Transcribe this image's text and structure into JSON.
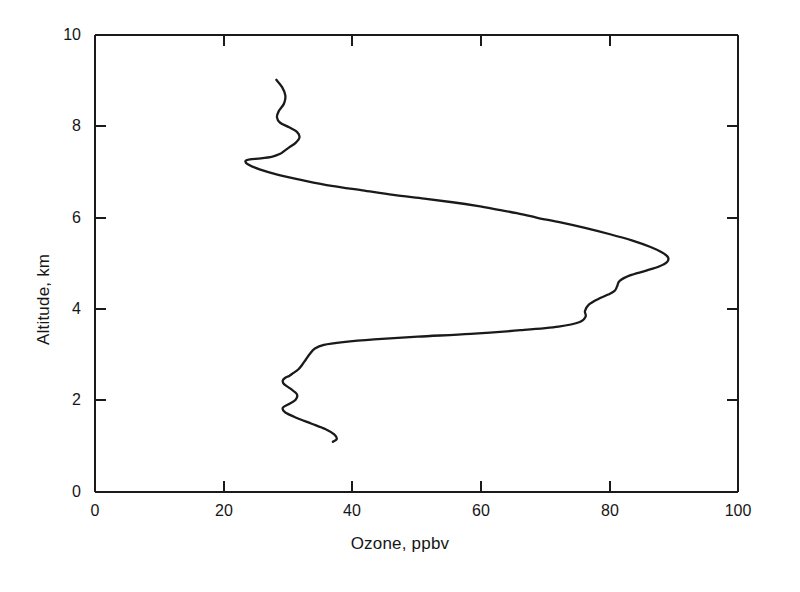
{
  "chart_data": {
    "type": "line",
    "title": "",
    "subtitle": "",
    "xlabel": "Ozone, ppbv",
    "ylabel": "Altitude, km",
    "xlim": [
      0,
      100
    ],
    "ylim": [
      0,
      10
    ],
    "xticks": [
      0,
      20,
      40,
      60,
      80,
      100
    ],
    "yticks": [
      0,
      2,
      4,
      6,
      8,
      10
    ],
    "xtick_labels": [
      "0",
      "20",
      "40",
      "60",
      "80",
      "100"
    ],
    "ytick_labels": [
      "0",
      "2",
      "4",
      "6",
      "8",
      "10"
    ],
    "grid": false,
    "legend": null,
    "orientation": "vertical-profile",
    "series": [
      {
        "name": "Ozone vertical profile",
        "color": "#1a1a1a",
        "x_values": [
          28.2,
          29.1,
          29.6,
          29.4,
          28.6,
          28.3,
          28.8,
          30.2,
          31.4,
          31.8,
          31.2,
          30.2,
          29.4,
          28.8,
          27.6,
          25.8,
          24.1,
          23.4,
          23.9,
          25.6,
          28.5,
          32.4,
          36.8,
          41.6,
          46.4,
          51.2,
          55.6,
          59.4,
          62.6,
          65.6,
          68.8,
          72.4,
          76.2,
          80.1,
          83.6,
          86.4,
          88.2,
          89.1,
          89.0,
          87.8,
          85.6,
          83.2,
          81.6,
          81.2,
          80.8,
          79.8,
          78.2,
          76.8,
          76.2,
          76.3,
          75.4,
          72.1,
          66.2,
          58.4,
          50.2,
          43.4,
          38.6,
          35.6,
          34.2,
          33.4,
          32.8,
          32.2,
          31.6,
          30.8,
          30.2,
          29.6,
          29.2,
          29.4,
          30.4,
          31.4,
          31.2,
          30.1,
          29.2,
          29.6,
          31.4,
          33.6,
          35.8,
          37.2,
          37.6,
          37.0
        ],
        "y_values": [
          9.02,
          8.86,
          8.68,
          8.5,
          8.34,
          8.2,
          8.08,
          7.98,
          7.88,
          7.76,
          7.64,
          7.54,
          7.46,
          7.4,
          7.34,
          7.3,
          7.28,
          7.24,
          7.16,
          7.06,
          6.94,
          6.82,
          6.7,
          6.6,
          6.5,
          6.42,
          6.34,
          6.26,
          6.18,
          6.1,
          6.0,
          5.9,
          5.78,
          5.64,
          5.5,
          5.36,
          5.24,
          5.14,
          5.04,
          4.94,
          4.84,
          4.74,
          4.62,
          4.5,
          4.4,
          4.32,
          4.22,
          4.1,
          3.96,
          3.84,
          3.72,
          3.62,
          3.54,
          3.46,
          3.4,
          3.34,
          3.28,
          3.22,
          3.14,
          3.02,
          2.9,
          2.78,
          2.68,
          2.6,
          2.54,
          2.5,
          2.44,
          2.36,
          2.26,
          2.14,
          2.02,
          1.92,
          1.84,
          1.74,
          1.62,
          1.5,
          1.38,
          1.26,
          1.16,
          1.1
        ],
        "peak_ozone_ppbv": 89,
        "peak_altitude_km": 5.1,
        "min_ozone_ppbv": 23.4,
        "min_altitude_km": 7.24,
        "top_altitude_km": 9.0,
        "bottom_altitude_km": 1.1
      }
    ]
  }
}
